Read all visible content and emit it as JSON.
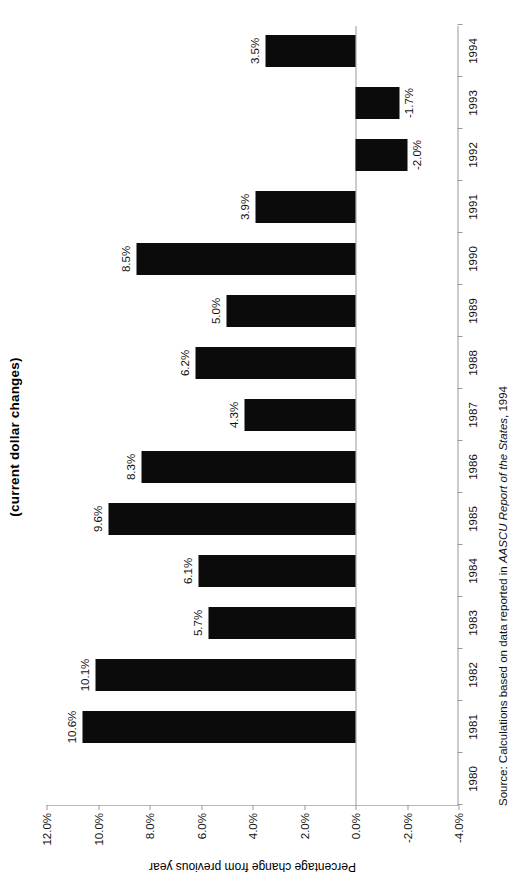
{
  "chart_data": {
    "type": "bar",
    "title": "(current dollar changes)",
    "title_note": "Title is clipped at the image edge; only the parenthetical line is visible.",
    "xlabel": "",
    "ylabel": "Percentage change from previous year",
    "orientation": "rotated-90-ccw",
    "grid": false,
    "legend": null,
    "categories": [
      "1980",
      "1981",
      "1982",
      "1983",
      "1984",
      "1985",
      "1986",
      "1987",
      "1988",
      "1989",
      "1990",
      "1991",
      "1992",
      "1993",
      "1994"
    ],
    "values": [
      null,
      10.6,
      10.1,
      5.7,
      6.1,
      9.6,
      8.3,
      4.3,
      6.2,
      5.0,
      8.5,
      3.9,
      -2.0,
      -1.7,
      3.5
    ],
    "data_labels": [
      "",
      "10.6%",
      "10.1%",
      "5.7%",
      "6.1%",
      "9.6%",
      "8.3%",
      "4.3%",
      "6.2%",
      "5.0%",
      "8.5%",
      "3.9%",
      "-2.0%",
      "-1.7%",
      "3.5%"
    ],
    "ylim": [
      -4.0,
      12.0
    ],
    "ytick_values": [
      12.0,
      10.0,
      8.0,
      6.0,
      4.0,
      2.0,
      0.0,
      -2.0,
      -4.0
    ],
    "ytick_labels": [
      "12.0%",
      "10.0%",
      "8.0%",
      "6.0%",
      "4.0%",
      "2.0%",
      "0.0%",
      "-2.0%",
      "-4.0%"
    ],
    "bar_color": "#0b0b0b",
    "axis_color": "#9a9a9a"
  },
  "source": {
    "prefix": "Source:  Calculations based on data reported in ",
    "italic": "AASCU Report of the States",
    "suffix": ", 1994"
  }
}
